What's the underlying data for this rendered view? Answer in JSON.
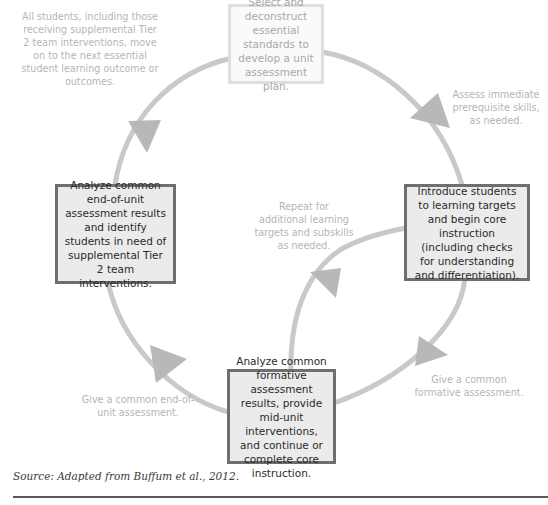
{
  "diagram": {
    "type": "cycle",
    "colors": {
      "box_fill": "#ebebeb",
      "box_border": "#6f6f6f",
      "box_text": "#2a2a2a",
      "faded_box_border": "#dedede",
      "faded_text": "#a8a8a8",
      "arrow": "#c4c4c4",
      "label_text": "#b5b5b5"
    },
    "boxes": {
      "top": "Select and deconstruct essential standards to develop a unit assessment plan.",
      "right": "Introduce students to learning targets and begin core instruction (including checks for understanding and differentiation).",
      "bottom": "Analyze common formative assessment results, provide mid-unit interventions, and continue or complete core instruction.",
      "left": "Analyze common end-of-unit assessment results and identify students in need of supplemental Tier 2 team interventions."
    },
    "labels": {
      "top_left": "All students, including those receiving supplemental Tier 2 team interventions, move on to the next essential student learning outcome or outcomes.",
      "top_right": "Assess immediate prerequisite skills, as needed.",
      "center": "Repeat for additional learning targets and subskills as needed.",
      "bottom_right": "Give a common formative assessment.",
      "bottom_left": "Give a common end-of-unit assessment."
    },
    "flow": [
      {
        "from": "top",
        "to": "right",
        "label": "top_right"
      },
      {
        "from": "right",
        "to": "bottom",
        "label": "bottom_right"
      },
      {
        "from": "bottom",
        "to": "right",
        "label": "center"
      },
      {
        "from": "bottom",
        "to": "left",
        "label": "bottom_left"
      },
      {
        "from": "left",
        "to": "top",
        "label": "top_left"
      }
    ]
  },
  "caption": {
    "source": "Source: Adapted from Buffum et al., 2012."
  }
}
